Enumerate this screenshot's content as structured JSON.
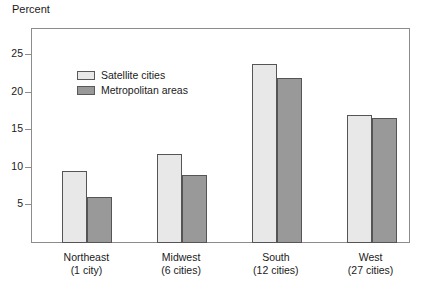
{
  "chart_data": {
    "type": "bar",
    "title": "",
    "subtitle": "",
    "ylabel": "Percent",
    "xlabel": "",
    "categories": [
      "Northeast",
      "Midwest",
      "South",
      "West"
    ],
    "category_sublabels": [
      "(1 city)",
      "(6 cities)",
      "(12 cities)",
      "(27 cities)"
    ],
    "series": [
      {
        "name": "Satellite cities",
        "values": [
          9.6,
          11.8,
          23.9,
          17.1
        ],
        "color": "#e8e8e8"
      },
      {
        "name": "Metropolitan areas",
        "values": [
          6.1,
          9.1,
          22.0,
          16.6
        ],
        "color": "#999999"
      }
    ],
    "ylim": [
      0,
      28.5
    ],
    "yticks": [
      5,
      10,
      15,
      20,
      25
    ],
    "ytick_labels": [
      "5",
      "10",
      "15",
      "20",
      "25"
    ],
    "grid": false,
    "legend_position": "top-left",
    "frame": true,
    "axis_color": "#8c8c8c",
    "bar_border_color": "#555555"
  },
  "legend": {
    "items": [
      {
        "label": "Satellite cities"
      },
      {
        "label": "Metropolitan areas"
      }
    ]
  }
}
